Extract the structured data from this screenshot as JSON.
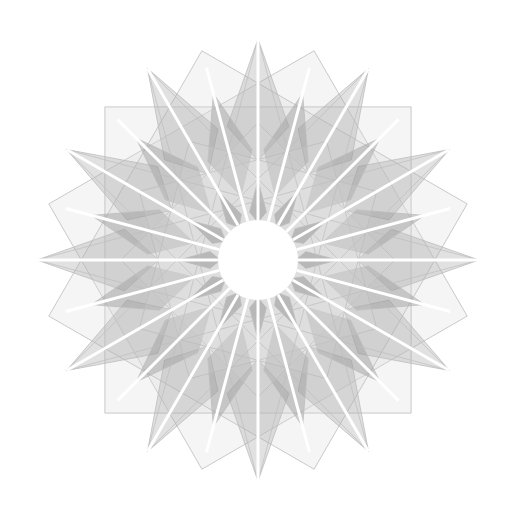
{
  "artwork": {
    "subject": "12-fold geometric star rosette, pencil and grey wash",
    "background": "#ffffff",
    "center": [
      258,
      260
    ],
    "outer_radius": 221,
    "points": 12,
    "inner_circle_radius": 40,
    "colors": {
      "line": "#bdbdbd",
      "light_wash": "#d6d6d6",
      "mid_wash": "#a9a9a9",
      "dark_wash": "#8a8a8a",
      "highlight": "#ffffff"
    }
  }
}
